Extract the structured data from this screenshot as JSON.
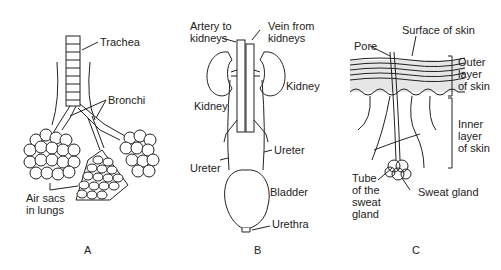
{
  "panels": [
    {
      "id": "A",
      "caption": "A",
      "labels": {
        "trachea": "Trachea",
        "bronchi": "Bronchi",
        "air_sacs": "Air sacs\nin lungs"
      }
    },
    {
      "id": "B",
      "caption": "B",
      "labels": {
        "artery": "Artery to\nkidneys",
        "vein": "Vein from\nkidneys",
        "kidney_right": "Kidney",
        "kidney_left": "Kidney",
        "ureter_right": "Ureter",
        "ureter_left": "Ureter",
        "bladder": "Bladder",
        "urethra": "Urethra"
      }
    },
    {
      "id": "C",
      "caption": "C",
      "labels": {
        "surface": "Surface of skin",
        "pore": "Pore",
        "outer_layer": "Outer\nlayer\nof skin",
        "inner_layer": "Inner\nlayer\nof skin",
        "tube": "Tube\nof the\nsweat\ngland",
        "sweat_gland": "Sweat gland"
      }
    }
  ]
}
